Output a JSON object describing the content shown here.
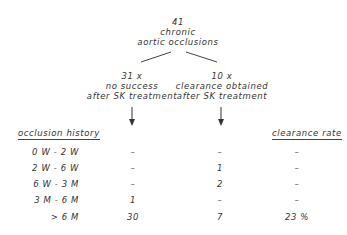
{
  "root": {
    "count": "41",
    "line1": "chronic",
    "line2": "aortic occlusions"
  },
  "branches": [
    {
      "count": "31 x",
      "line1": "no success",
      "line2": "after SK treatment"
    },
    {
      "count": "10 x",
      "line1": "clearance obtained",
      "line2": "after SK treatment"
    }
  ],
  "table": {
    "left_header": "occlusion history",
    "right_header": "clearance rate",
    "rows": [
      {
        "label": "0 W  -  2 W",
        "no_success": "–",
        "cleared": "–",
        "rate": "–"
      },
      {
        "label": "2 W  -  6 W",
        "no_success": "–",
        "cleared": "1",
        "rate": "–"
      },
      {
        "label": "6 W  -  3 M",
        "no_success": "–",
        "cleared": "2",
        "rate": "–"
      },
      {
        "label": "3 M  -  6 M",
        "no_success": "1",
        "cleared": "–",
        "rate": "–"
      },
      {
        "label": "> 6 M",
        "no_success": "30",
        "cleared": "7",
        "rate": "23 %"
      }
    ]
  }
}
